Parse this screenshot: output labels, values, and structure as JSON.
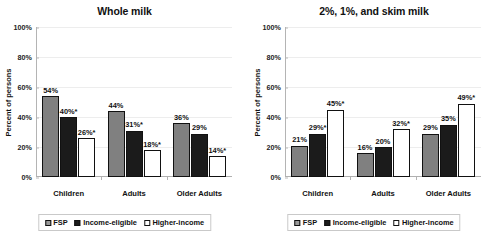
{
  "chart_data": [
    {
      "type": "bar",
      "title": "Whole milk",
      "xlabel": "",
      "ylabel": "Percent of persons",
      "ylim": [
        0,
        100
      ],
      "ytick_labels": [
        "0%",
        "20%",
        "40%",
        "60%",
        "80%",
        "100%"
      ],
      "ytick_values": [
        0,
        20,
        40,
        60,
        80,
        100
      ],
      "grid": true,
      "legend_position": "bottom",
      "categories": [
        "Children",
        "Adults",
        "Older Adults"
      ],
      "series": [
        {
          "name": "FSP",
          "color": "#808080",
          "values": [
            54,
            44,
            36
          ],
          "data_labels": [
            "54%",
            "44%",
            "36%"
          ]
        },
        {
          "name": "Income-eligible",
          "color": "#1b1b1b",
          "values": [
            40,
            31,
            29
          ],
          "data_labels": [
            "40%*",
            "31%*",
            "29%"
          ]
        },
        {
          "name": "Higher-income",
          "color": "#ffffff",
          "values": [
            26,
            18,
            14
          ],
          "data_labels": [
            "26%*",
            "18%*",
            "14%*"
          ]
        }
      ]
    },
    {
      "type": "bar",
      "title": "2%, 1%, and skim milk",
      "xlabel": "",
      "ylabel": "Percent of persons",
      "ylim": [
        0,
        100
      ],
      "ytick_labels": [
        "0%",
        "20%",
        "40%",
        "60%",
        "80%",
        "100%"
      ],
      "ytick_values": [
        0,
        20,
        40,
        60,
        80,
        100
      ],
      "grid": true,
      "legend_position": "bottom",
      "categories": [
        "Children",
        "Adults",
        "Older Adults"
      ],
      "series": [
        {
          "name": "FSP",
          "color": "#808080",
          "values": [
            21,
            16,
            29
          ],
          "data_labels": [
            "21%",
            "16%",
            "29%"
          ]
        },
        {
          "name": "Income-eligible",
          "color": "#1b1b1b",
          "values": [
            29,
            20,
            35
          ],
          "data_labels": [
            "29%*",
            "20%",
            "35%"
          ]
        },
        {
          "name": "Higher-income",
          "color": "#ffffff",
          "values": [
            45,
            32,
            49
          ],
          "data_labels": [
            "45%*",
            "32%*",
            "49%*"
          ]
        }
      ]
    }
  ]
}
